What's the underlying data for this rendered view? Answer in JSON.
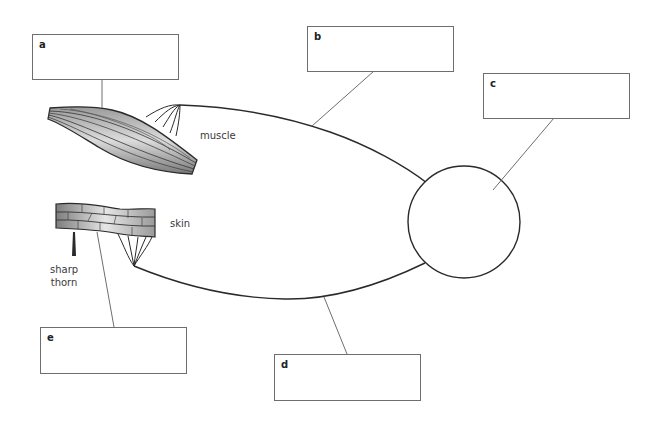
{
  "diagram": {
    "colors": {
      "line": "#2a2a2a",
      "pointer": "#6e6e6e",
      "box_border": "#6e6e6e",
      "text": "#3a3a3a"
    },
    "labels": {
      "muscle": "muscle",
      "skin": "skin",
      "thorn_line1": "sharp",
      "thorn_line2": "thorn"
    },
    "boxes": [
      {
        "letter": "a",
        "value": ""
      },
      {
        "letter": "b",
        "value": ""
      },
      {
        "letter": "c",
        "value": ""
      },
      {
        "letter": "d",
        "value": ""
      },
      {
        "letter": "e",
        "value": ""
      }
    ],
    "parts": [
      "muscle",
      "skin",
      "sharp thorn",
      "upper neuron",
      "lower neuron",
      "spinal cord circle"
    ]
  }
}
